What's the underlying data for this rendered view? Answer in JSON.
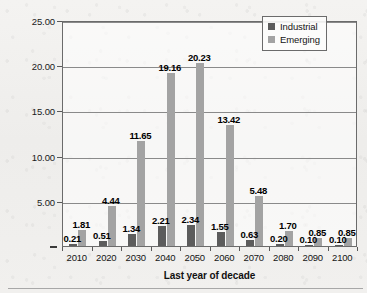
{
  "chart_data": {
    "type": "bar",
    "title": "",
    "xlabel": "Last year of decade",
    "ylabel": "Avge annual primary energy increase (EJ)",
    "categories": [
      "2010",
      "2020",
      "2030",
      "2040",
      "2050",
      "2060",
      "2070",
      "2080",
      "2090",
      "2100"
    ],
    "series": [
      {
        "name": "Industrial",
        "color": "#5c5c5c",
        "values": [
          0.21,
          0.51,
          1.34,
          2.21,
          2.34,
          1.55,
          0.63,
          0.2,
          0.1,
          0.1
        ],
        "labels": [
          "0.21",
          "0.51",
          "1.34",
          "2.21",
          "2.34",
          "1.55",
          "0.63",
          "0.20",
          "0.10",
          "0.10"
        ]
      },
      {
        "name": "Emerging",
        "color": "#a3a3a3",
        "values": [
          1.81,
          4.44,
          11.65,
          19.16,
          20.23,
          13.42,
          5.48,
          1.7,
          0.85,
          0.85
        ],
        "labels": [
          "1.81",
          "4.44",
          "11.65",
          "19.16",
          "20.23",
          "13.42",
          "5.48",
          "1.70",
          "0.85",
          "0.85"
        ]
      }
    ],
    "ylim": [
      0,
      25
    ],
    "ytick_values": [
      25,
      20,
      15,
      10,
      5,
      0
    ],
    "ytick_labels": [
      "25.00",
      "20.00",
      "15.00",
      "10.00",
      "5.00",
      "-"
    ],
    "grid": true,
    "legend_position": "top-right",
    "legend_entries": [
      "Industrial",
      "Emerging"
    ]
  }
}
